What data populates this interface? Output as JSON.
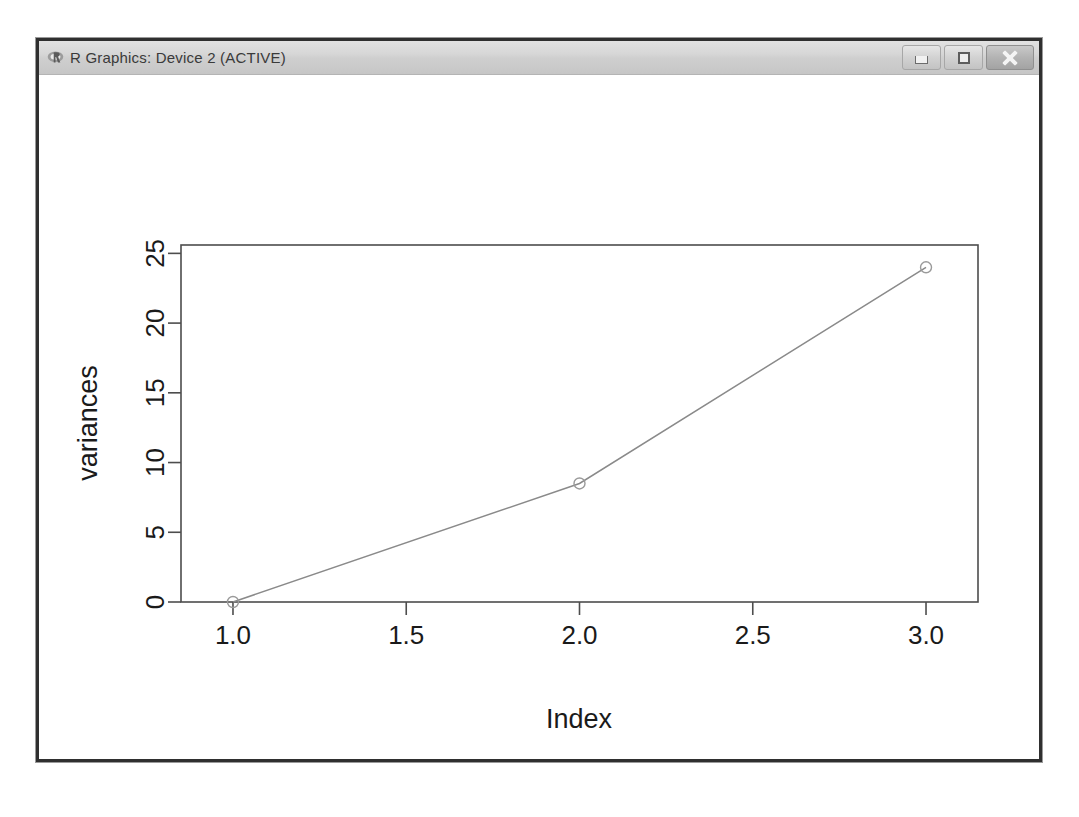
{
  "window": {
    "title": "R Graphics: Device 2 (ACTIVE)",
    "icon": "r-logo-icon",
    "controls": [
      {
        "name": "minimize-button",
        "label": "Minimize",
        "glyph": "minimize-icon"
      },
      {
        "name": "maximize-button",
        "label": "Maximize",
        "glyph": "maximize-icon"
      },
      {
        "name": "close-button",
        "label": "Close",
        "glyph": "close-icon"
      }
    ],
    "colors": {
      "border": "#2f2f2f",
      "titlebar_top": "#e2e2e2",
      "titlebar_bottom": "#c6c6c6",
      "title_text": "#3a3a3a",
      "canvas": "#ffffff"
    }
  },
  "chart_data": {
    "type": "line",
    "title": "",
    "xlabel": "Index",
    "ylabel": "variances",
    "x": [
      1,
      2,
      3
    ],
    "values": [
      0,
      8.5,
      24
    ],
    "series": [
      {
        "name": "variances",
        "values": [
          0,
          8.5,
          24
        ]
      }
    ],
    "xlim": [
      0.85,
      3.15
    ],
    "ylim": [
      0,
      25.6
    ],
    "xticks": [
      1.0,
      1.5,
      2.0,
      2.5,
      3.0
    ],
    "xtick_labels": [
      "1.0",
      "1.5",
      "2.0",
      "2.5",
      "3.0"
    ],
    "yticks": [
      0,
      5,
      10,
      15,
      20,
      25
    ],
    "ytick_labels": [
      "0",
      "5",
      "10",
      "15",
      "20",
      "25"
    ],
    "grid": false,
    "legend": null,
    "marker": "circle",
    "line_color": "#8a8a8a",
    "marker_color": "#9a9a9a",
    "axis_color": "#4d4d4d",
    "text_color": "#1a1a1a"
  }
}
